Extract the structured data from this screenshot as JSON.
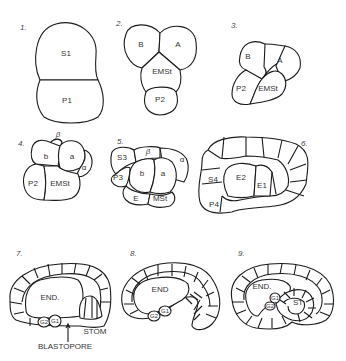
{
  "figure": {
    "panels": [
      {
        "number": "1.",
        "cells": [
          "S1",
          "P1"
        ]
      },
      {
        "number": "2.",
        "cells": [
          "B",
          "A",
          "EMSt",
          "P2"
        ]
      },
      {
        "number": "3.",
        "cells": [
          "B",
          "A",
          "P2",
          "EMSt"
        ]
      },
      {
        "number": "4.",
        "cells": [
          "β",
          "b",
          "a",
          "α",
          "P2",
          "EMSt"
        ]
      },
      {
        "number": "5.",
        "cells": [
          "S3",
          "β",
          "α",
          "P3",
          "b",
          "a",
          "E",
          "MSt"
        ]
      },
      {
        "number": "6.",
        "cells": [
          "S4",
          "E2",
          "E1",
          "P4"
        ]
      },
      {
        "number": "7.",
        "cells": [
          "END.",
          "G2",
          "G1",
          "STOM",
          "BLASTOPORE"
        ]
      },
      {
        "number": "8.",
        "cells": [
          "END",
          "G2",
          "G1"
        ]
      },
      {
        "number": "9.",
        "cells": [
          "END.",
          "G1",
          "G2",
          "ST"
        ]
      }
    ]
  }
}
